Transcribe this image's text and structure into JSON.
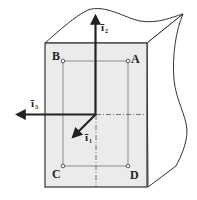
{
  "diagram": {
    "type": "3D block with coordinate axes",
    "colors": {
      "stroke": "#333333",
      "face_fill": "#ebebeb",
      "background": "#ffffff",
      "guide_lines": "#666666"
    },
    "points": [
      {
        "id": "A",
        "label": "A"
      },
      {
        "id": "B",
        "label": "B"
      },
      {
        "id": "C",
        "label": "C"
      },
      {
        "id": "D",
        "label": "D"
      }
    ],
    "axes": [
      {
        "id": "i1",
        "symbol": "ī",
        "subscript": "1",
        "direction": "down-left (out of page)"
      },
      {
        "id": "i2",
        "symbol": "ī",
        "subscript": "2",
        "direction": "up"
      },
      {
        "id": "i3",
        "symbol": "ī",
        "subscript": "3",
        "direction": "left"
      }
    ]
  }
}
